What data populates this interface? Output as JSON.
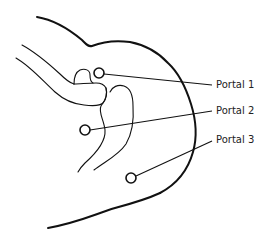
{
  "diagram": {
    "line_color": "#111111",
    "background": "#ffffff",
    "portals": [
      {
        "id": "portal-1",
        "label": "Portal 1"
      },
      {
        "id": "portal-2",
        "label": "Portal 2"
      },
      {
        "id": "portal-3",
        "label": "Portal 3"
      }
    ]
  }
}
